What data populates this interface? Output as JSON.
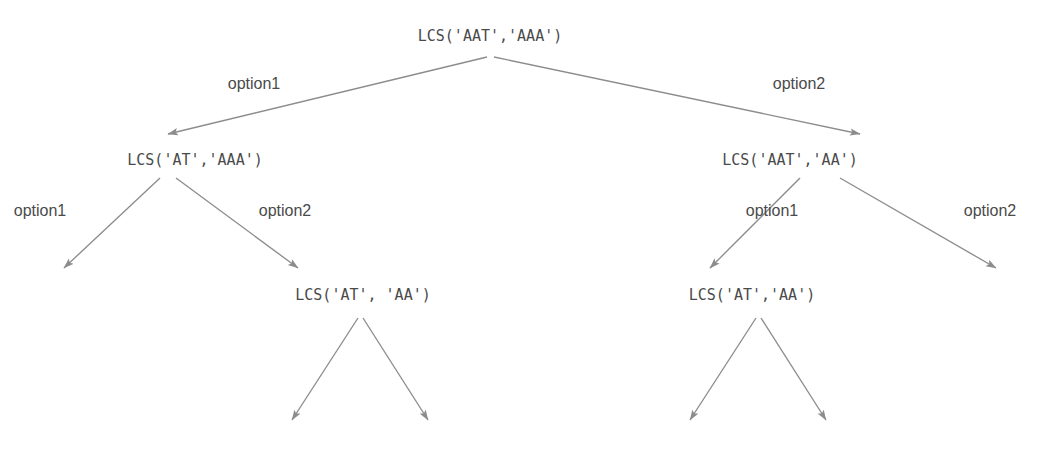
{
  "diagram": {
    "title_text": "LCS recursion tree",
    "line_color": "#8c8c8c",
    "text_color": "#4a4a4a",
    "background": "#ffffff",
    "nodes": [
      {
        "id": "root",
        "label": "LCS('AAT','AAA')",
        "x": 490,
        "y": 36
      },
      {
        "id": "l1",
        "label": "LCS('AT','AAA')",
        "x": 195,
        "y": 160
      },
      {
        "id": "r1",
        "label": "LCS('AAT','AA')",
        "x": 790,
        "y": 160
      },
      {
        "id": "l2",
        "label": "LCS('AT', 'AA')",
        "x": 363,
        "y": 295
      },
      {
        "id": "r2",
        "label": "LCS('AT','AA')",
        "x": 752,
        "y": 295
      }
    ],
    "edge_labels": [
      {
        "id": "root-option1",
        "label": "option1",
        "x": 254,
        "y": 84
      },
      {
        "id": "root-option2",
        "label": "option2",
        "x": 799,
        "y": 84
      },
      {
        "id": "l1-option1",
        "label": "option1",
        "x": 40,
        "y": 211
      },
      {
        "id": "l1-option2",
        "label": "option2",
        "x": 285,
        "y": 211
      },
      {
        "id": "r1-option1",
        "label": "option1",
        "x": 772,
        "y": 211
      },
      {
        "id": "r1-option2",
        "label": "option2",
        "x": 990,
        "y": 211
      }
    ],
    "edges": [
      {
        "id": "root-to-l1",
        "from": "root",
        "to": "l1",
        "x1": 487,
        "y1": 57,
        "x2": 168,
        "y2": 134
      },
      {
        "id": "root-to-r1",
        "from": "root",
        "to": "r1",
        "x1": 494,
        "y1": 57,
        "x2": 860,
        "y2": 134
      },
      {
        "id": "l1-to-dangling-left",
        "from": "l1",
        "to": "none",
        "x1": 160,
        "y1": 178,
        "x2": 64,
        "y2": 268
      },
      {
        "id": "l1-to-l2",
        "from": "l1",
        "to": "l2",
        "x1": 176,
        "y1": 178,
        "x2": 298,
        "y2": 268
      },
      {
        "id": "r1-to-r2",
        "from": "r1",
        "to": "r2",
        "x1": 800,
        "y1": 178,
        "x2": 710,
        "y2": 268
      },
      {
        "id": "r1-to-dangling-right",
        "from": "r1",
        "to": "none",
        "x1": 840,
        "y1": 178,
        "x2": 996,
        "y2": 268
      },
      {
        "id": "l2-to-dangling-left",
        "from": "l2",
        "to": "none",
        "x1": 358,
        "y1": 318,
        "x2": 292,
        "y2": 420
      },
      {
        "id": "l2-to-dangling-right",
        "from": "l2",
        "to": "none",
        "x1": 363,
        "y1": 318,
        "x2": 428,
        "y2": 420
      },
      {
        "id": "r2-to-dangling-left",
        "from": "r2",
        "to": "none",
        "x1": 756,
        "y1": 318,
        "x2": 690,
        "y2": 420
      },
      {
        "id": "r2-to-dangling-right",
        "from": "r2",
        "to": "none",
        "x1": 761,
        "y1": 318,
        "x2": 826,
        "y2": 420
      }
    ]
  }
}
